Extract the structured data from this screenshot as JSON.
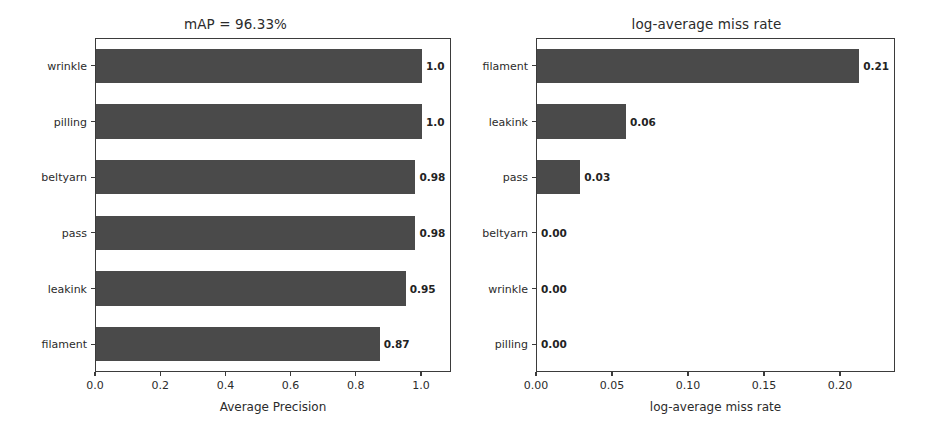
{
  "figure": {
    "width": 942,
    "height": 433,
    "background": "#ffffff",
    "bar_color": "#4a4a4a",
    "axis_color": "#3b3b3b",
    "text_color": "#2b2b2b"
  },
  "chart_data": [
    {
      "id": "average-precision",
      "type": "bar",
      "orientation": "horizontal",
      "title": "mAP = 96.33%",
      "xlabel": "Average Precision",
      "ylabel": "",
      "categories": [
        "wrinkle",
        "pilling",
        "beltyarn",
        "pass",
        "leakink",
        "filament"
      ],
      "values": [
        1.0,
        1.0,
        0.98,
        0.98,
        0.95,
        0.87
      ],
      "value_labels": [
        "1.0",
        "1.0",
        "0.98",
        "0.98",
        "0.95",
        "0.87"
      ],
      "xticks": [
        0.0,
        0.2,
        0.4,
        0.6,
        0.8,
        1.0
      ],
      "xtick_labels": [
        "0.0",
        "0.2",
        "0.4",
        "0.6",
        "0.8",
        "1.0"
      ],
      "xlim": [
        0.0,
        1.092
      ],
      "grid": false,
      "legend": null,
      "plot_box": {
        "left": 95,
        "top": 38,
        "right": 451,
        "bottom": 372
      },
      "title_center_x": 273,
      "title_y": 16
    },
    {
      "id": "log-average-miss-rate",
      "type": "bar",
      "orientation": "horizontal",
      "title": "log-average miss rate",
      "xlabel": "log-average miss rate",
      "ylabel": "",
      "categories": [
        "filament",
        "leakink",
        "pass",
        "beltyarn",
        "wrinkle",
        "pilling"
      ],
      "values": [
        0.212,
        0.0585,
        0.0285,
        0.0,
        0.0,
        0.0
      ],
      "value_labels": [
        "0.21",
        "0.06",
        "0.03",
        "0.00",
        "0.00",
        "0.00"
      ],
      "xticks": [
        0.0,
        0.05,
        0.1,
        0.15,
        0.2
      ],
      "xtick_labels": [
        "0.00",
        "0.05",
        "0.10",
        "0.15",
        "0.20"
      ],
      "xlim": [
        0.0,
        0.2362
      ],
      "grid": false,
      "legend": null,
      "plot_box": {
        "left": 536,
        "top": 38,
        "right": 895,
        "bottom": 372
      },
      "title_center_x": 716,
      "title_y": 16
    }
  ]
}
